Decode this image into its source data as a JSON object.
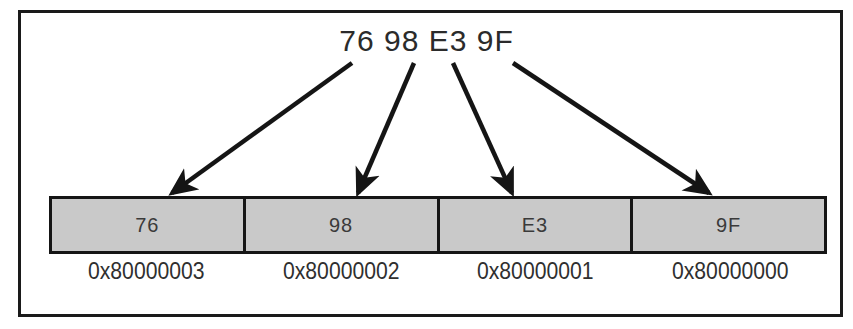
{
  "figure": {
    "value_label": "76 98 E3 9F"
  },
  "memory": {
    "cells": [
      {
        "byte": "76",
        "address": "0x80000003"
      },
      {
        "byte": "98",
        "address": "0x80000002"
      },
      {
        "byte": "E3",
        "address": "0x80000001"
      },
      {
        "byte": "9F",
        "address": "0x80000000"
      }
    ]
  },
  "arrows": [
    {
      "name": "arrow-to-byte-76",
      "x1": 352,
      "y1": 63,
      "x2": 172,
      "y2": 193
    },
    {
      "name": "arrow-to-byte-98",
      "x1": 414,
      "y1": 63,
      "x2": 358,
      "y2": 193
    },
    {
      "name": "arrow-to-byte-e3",
      "x1": 453,
      "y1": 63,
      "x2": 512,
      "y2": 193
    },
    {
      "name": "arrow-to-byte-9f",
      "x1": 513,
      "y1": 63,
      "x2": 709,
      "y2": 193
    }
  ],
  "colors": {
    "ink": "#1a1a1a",
    "cell_fill": "#c9c9c9",
    "text": "#2f2f2f"
  }
}
